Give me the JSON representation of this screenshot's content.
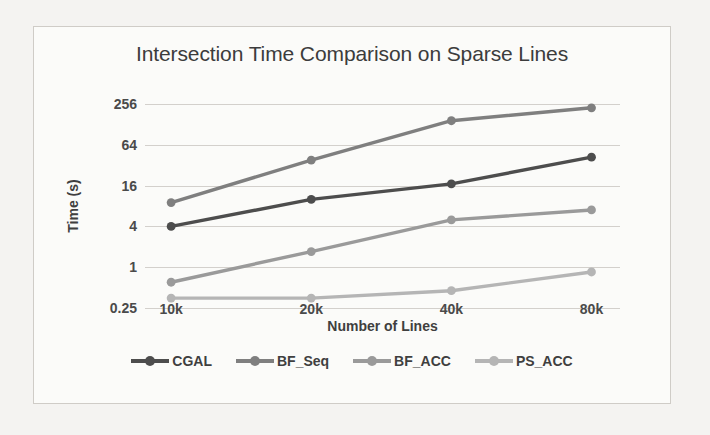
{
  "figure": {
    "title": "Intersection Time Comparison on Sparse Lines"
  },
  "background_text": {
    "lines": [
      "",
      "",
      "",
      "",
      "",
      "",
      "",
      "",
      "",
      ""
    ]
  },
  "legend": {
    "position": "bottom",
    "items": [
      {
        "label": "CGAL",
        "color": "#4d4d4d"
      },
      {
        "label": "BF_Seq",
        "color": "#7f7f7f"
      },
      {
        "label": "BF_ACC",
        "color": "#9a9a9a"
      },
      {
        "label": "PS_ACC",
        "color": "#b5b5b5"
      }
    ]
  },
  "chart_data": {
    "type": "line",
    "title": "Intersection Time Comparison on Sparse Lines",
    "xlabel": "Number of Lines",
    "ylabel": "Time (s)",
    "categories": [
      "10k",
      "20k",
      "40k",
      "80k"
    ],
    "yscale": "log",
    "log_base": 4,
    "yticks": [
      256,
      64,
      16,
      4,
      1,
      0.25
    ],
    "ytick_labels": [
      "256",
      "64",
      "16",
      "4",
      "1",
      "0.25"
    ],
    "ylim": [
      0.25,
      256
    ],
    "grid": true,
    "series": [
      {
        "name": "CGAL",
        "color": "#4d4d4d",
        "values": [
          4.0,
          10.0,
          17.0,
          42.0
        ]
      },
      {
        "name": "BF_Seq",
        "color": "#7f7f7f",
        "values": [
          9.0,
          38.0,
          145.0,
          225.0
        ]
      },
      {
        "name": "BF_ACC",
        "color": "#9a9a9a",
        "values": [
          0.6,
          1.7,
          5.0,
          7.0
        ]
      },
      {
        "name": "PS_ACC",
        "color": "#b5b5b5",
        "values": [
          0.35,
          0.35,
          0.45,
          0.85
        ]
      }
    ]
  }
}
